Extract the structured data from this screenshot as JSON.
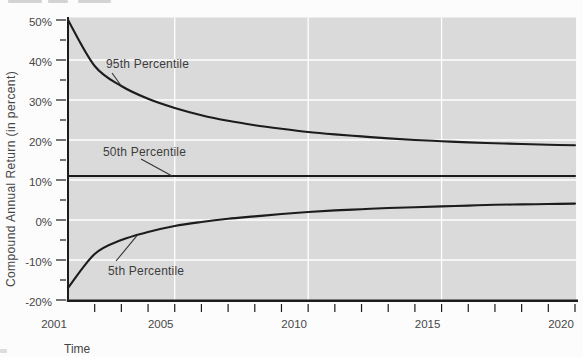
{
  "colors": {
    "page_background": "#fcfcfc",
    "plot_background": "#dadada",
    "gridline": "#ffffff",
    "line": "#1c1c1c",
    "axis": "#1c1c1c",
    "text": "#474747"
  },
  "chart_data": {
    "type": "line",
    "title": "",
    "xlabel": "Time",
    "ylabel": "Compound Annual Return (in percent)",
    "x": [
      2001,
      2002,
      2003,
      2004,
      2005,
      2006,
      2007,
      2008,
      2009,
      2010,
      2011,
      2012,
      2013,
      2014,
      2015,
      2016,
      2017,
      2018,
      2019,
      2020
    ],
    "series": [
      {
        "name": "95th Percentile",
        "values": [
          50.0,
          38.5,
          33.5,
          30.3,
          28.0,
          26.2,
          24.8,
          23.7,
          22.8,
          22.0,
          21.4,
          20.9,
          20.4,
          20.0,
          19.7,
          19.4,
          19.2,
          19.0,
          18.8,
          18.7
        ]
      },
      {
        "name": "50th Percentile",
        "values": [
          11.0,
          11.0,
          11.0,
          11.0,
          11.0,
          11.0,
          11.0,
          11.0,
          11.0,
          11.0,
          11.0,
          11.0,
          11.0,
          11.0,
          11.0,
          11.0,
          11.0,
          11.0,
          11.0,
          11.0
        ]
      },
      {
        "name": "5th Percentile",
        "values": [
          -17.0,
          -8.5,
          -5.0,
          -3.0,
          -1.5,
          -0.5,
          0.3,
          0.9,
          1.5,
          2.0,
          2.4,
          2.7,
          3.0,
          3.2,
          3.4,
          3.6,
          3.8,
          3.9,
          4.0,
          4.1
        ]
      }
    ],
    "xlim": [
      2001,
      2020
    ],
    "ylim": [
      -20,
      50
    ],
    "x_ticks": [
      2001,
      2005,
      2010,
      2015,
      2020
    ],
    "x_tick_labels": [
      "2001",
      "2005",
      "2010",
      "2015",
      "2020"
    ],
    "x_minor_tick_step": 1,
    "y_ticks": [
      50,
      40,
      30,
      20,
      10,
      0,
      -10,
      -20
    ],
    "y_tick_labels": [
      "50%",
      "40%",
      "30%",
      "20%",
      "10%",
      "0%",
      "-10%",
      "-20%"
    ],
    "y_minor_tick_step": 5,
    "grid": true,
    "legend_position": "none",
    "annotations": [
      {
        "text": "95th Percentile",
        "series": "95th Percentile"
      },
      {
        "text": "50th Percentile",
        "series": "50th Percentile"
      },
      {
        "text": "5th Percentile",
        "series": "5th Percentile"
      }
    ]
  }
}
